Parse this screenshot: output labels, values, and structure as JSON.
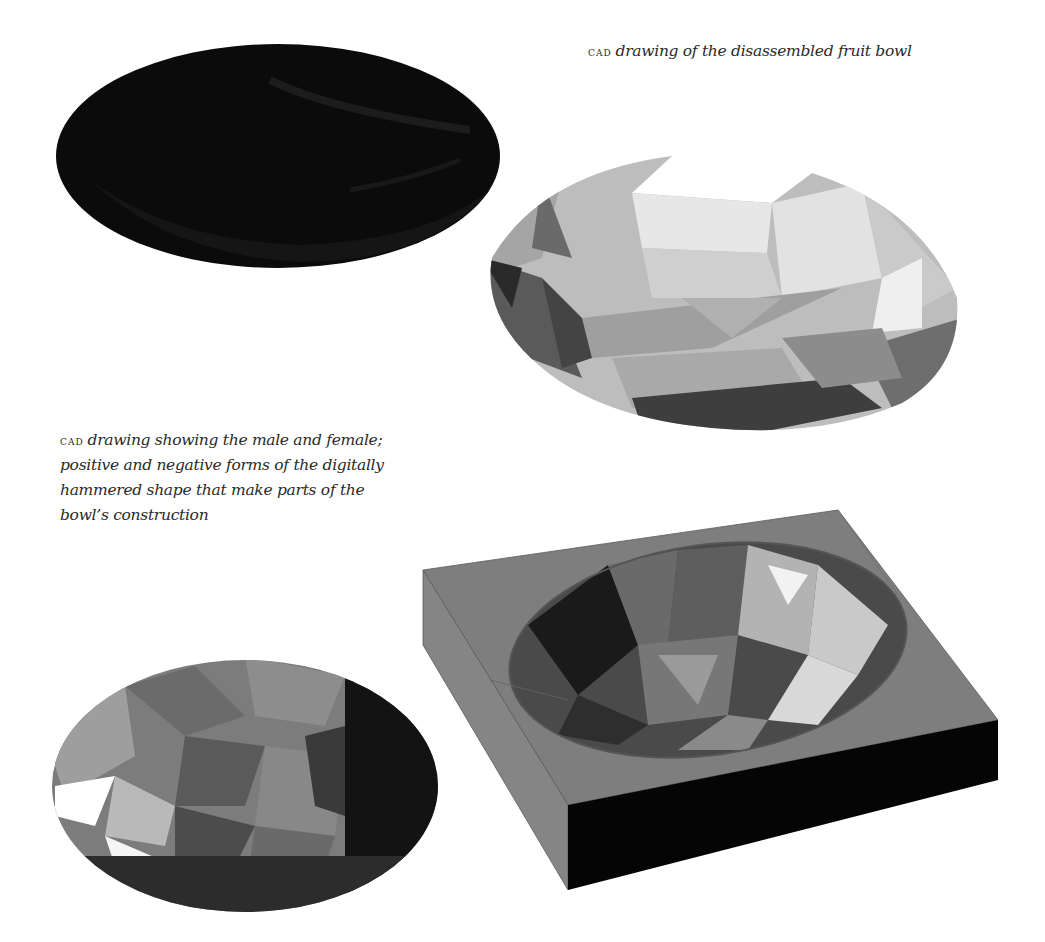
{
  "captions": {
    "top": {
      "prefix": "CAD",
      "text": "drawing of the disassembled fruit bowl"
    },
    "left": {
      "prefix": "CAD",
      "text": "drawing showing the male and female; positive and negative forms of the digitally hammered shape that make parts of the bowl’s construction"
    }
  },
  "figures": [
    {
      "name": "black-bowl-render",
      "shade": "#0a0a0a"
    },
    {
      "name": "faceted-bowl-render",
      "shade": "#b8b8b8"
    },
    {
      "name": "positive-form-render",
      "shade": "#6e6e6e"
    },
    {
      "name": "negative-mould-block-render",
      "shade": "#7a7a7a"
    }
  ]
}
